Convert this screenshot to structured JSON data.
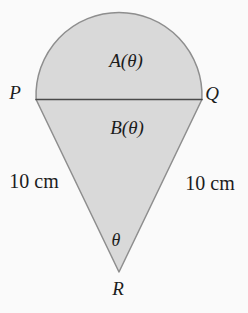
{
  "figure": {
    "colors": {
      "bg": "#fafafa",
      "shape-fill": "#d9d9d9",
      "outline": "#8e8e8e",
      "chord": "#4a4a4a",
      "text": "#1c1c1c"
    },
    "labels": {
      "p": "P",
      "q": "Q",
      "r": "R",
      "region_a": "A(θ)",
      "region_b": "B(θ)",
      "theta": "θ",
      "left_side": "10 cm",
      "right_side": "10 cm"
    }
  }
}
